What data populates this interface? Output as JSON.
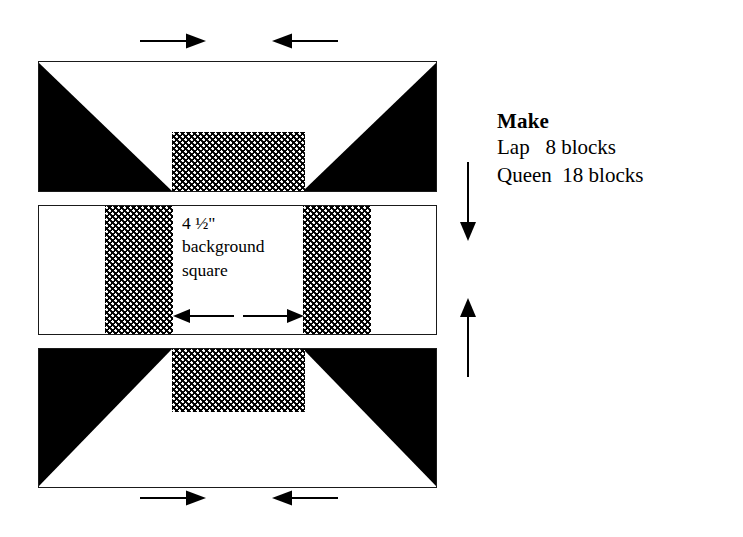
{
  "diagram": {
    "colors": {
      "fabric_dark": "#000000",
      "fabric_print": "#000000",
      "background_fabric": "#ffffff",
      "outline": "#1a1a1a"
    },
    "rows": [
      {
        "name": "top-row",
        "description": "Flying-geese style unit: dark triangles at left and right, background square top-center, print rectangle bottom-center"
      },
      {
        "name": "middle-row",
        "description": "Background square flanked by two print strips, background rectangles at far left and right"
      },
      {
        "name": "bottom-row",
        "description": "Mirror of top row: print rectangle top-center, background square bottom-center, dark triangles left and right"
      }
    ],
    "measure_label": "4 ½\"\nbackground\nsquare"
  },
  "make": {
    "heading": "Make",
    "rows": [
      {
        "size": "Lap",
        "count": "8 blocks",
        "line": "Lap   8 blocks"
      },
      {
        "size": "Queen",
        "count": "18 blocks",
        "line": "Queen  18 blocks"
      }
    ]
  },
  "arrows": {
    "top_left": {
      "name": "press-right-arrow",
      "direction": "right"
    },
    "top_right": {
      "name": "press-left-arrow",
      "direction": "left"
    },
    "bottom_left": {
      "name": "press-right-arrow",
      "direction": "right"
    },
    "bottom_right": {
      "name": "press-left-arrow",
      "direction": "left"
    },
    "middle_left": {
      "name": "width-left-arrow",
      "direction": "left"
    },
    "middle_right": {
      "name": "width-right-arrow",
      "direction": "right"
    },
    "side_down": {
      "name": "press-down-arrow",
      "direction": "down"
    },
    "side_up": {
      "name": "press-up-arrow",
      "direction": "up"
    }
  }
}
